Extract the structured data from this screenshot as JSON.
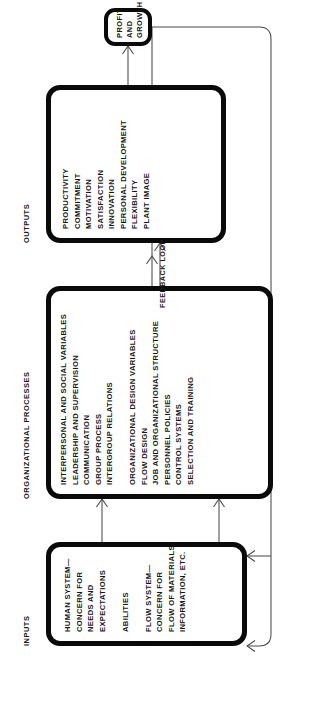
{
  "diagram": {
    "accent_color": "#0a0a0a",
    "line_color": "#4a4a4a",
    "background": "#ffffff",
    "columns": [
      {
        "id": "inputs",
        "label": "INPUTS",
        "items": [
          "HUMAN SYSTEM—",
          "CONCERN FOR",
          "NEEDS AND",
          "EXPECTATIONS",
          "ABILITIES",
          "FLOW SYSTEM—",
          "CONCERN FOR",
          "FLOW OF MATERIALS,",
          "INFORMATION, ETC."
        ]
      },
      {
        "id": "organizational-processes",
        "label": "ORGANIZATIONAL PROCESSES",
        "items": [
          "INTERPERSONAL AND SOCIAL VARIABLES",
          "LEADERSHIP AND SUPERVISION",
          "COMMUNICATION",
          "GROUP PROCESS",
          "INTERGROUP RELATIONS",
          "ORGANIZATIONAL DESIGN VARIABLES",
          "FLOW DESIGN",
          "JOB AND ORGANIZATIONAL STRUCTURE",
          "PERSONNEL POLICIES",
          "CONTROL SYSTEMS",
          "SELECTION AND TRAINING"
        ]
      },
      {
        "id": "outputs",
        "label": "OUTPUTS",
        "items": [
          "PRODUCTIVITY",
          "COMMITMENT",
          "MOTIVATION",
          "SATISFACTION",
          "INNOVATION",
          "PERSONAL DEVELOPMENT",
          "FLEXIBILITY",
          "PLANT IMAGE"
        ]
      }
    ],
    "result_node": {
      "id": "profit-and-growth",
      "line1": "PROFIT",
      "line2": "AND",
      "line3": "GROWTH"
    },
    "feedback": {
      "label": "FEEDBACK LOOP"
    }
  }
}
